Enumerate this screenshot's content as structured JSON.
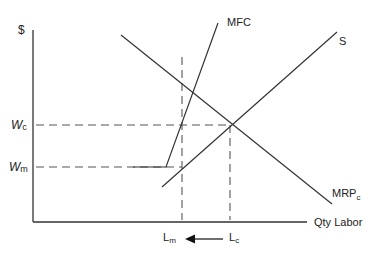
{
  "diagram": {
    "type": "monopsony-labor-market",
    "y_axis_label": "$",
    "x_axis_label": "Qty Labor",
    "curves": {
      "mfc": {
        "label": "MFC"
      },
      "supply": {
        "label": "S"
      },
      "mrp": {
        "label_main": "MRP",
        "label_sub": "c"
      }
    },
    "wages": {
      "wc": {
        "main": "W",
        "sub": "c"
      },
      "wm": {
        "main": "W",
        "sub": "m"
      }
    },
    "quantities": {
      "lm": {
        "main": "L",
        "sub": "m"
      },
      "lc": {
        "main": "L",
        "sub": "c"
      }
    },
    "arrow": {
      "from": "Lc",
      "to": "Lm",
      "direction": "left"
    },
    "colors": {
      "line": "#333333",
      "dash": "#555555",
      "text": "#222222"
    }
  }
}
